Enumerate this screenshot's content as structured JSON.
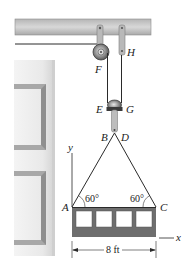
{
  "diagram": {
    "title": "",
    "points": {
      "A": "A",
      "B": "B",
      "C": "C",
      "D": "D",
      "E": "E",
      "F": "F",
      "G": "G",
      "H": "H"
    },
    "axes": {
      "x": "x",
      "y": "y"
    },
    "angles": {
      "left": "60°",
      "right": "60°"
    },
    "dimension": {
      "width": "8 ft"
    },
    "colors": {
      "beam": "#c9c9c9",
      "wall": "#e6e6e6",
      "frame": "#6e6e6e",
      "rope": "#2a2a2a",
      "window_trim": "#a8a8a8"
    }
  }
}
